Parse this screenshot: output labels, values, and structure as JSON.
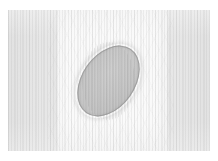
{
  "figure": {
    "kind": "grayscale-field-image",
    "canvas": {
      "width_px": 218,
      "height_px": 161,
      "page_background": "#ffffff"
    },
    "field_region": {
      "left_px": 8,
      "top_px": 10,
      "width_px": 202,
      "height_px": 141,
      "background_color": "#fbfbfb"
    },
    "background_bands": [
      {
        "name": "left-band",
        "left_px": 0,
        "width_px": 49,
        "color": "#e6e6e6",
        "tone": "darker"
      },
      {
        "name": "center-band",
        "left_px": 49,
        "width_px": 110,
        "color": "#fafafa",
        "tone": "lighter"
      },
      {
        "name": "right-band",
        "left_px": 159,
        "width_px": 43,
        "color": "#e6e6e6",
        "tone": "darker"
      }
    ],
    "texture": {
      "name": "vertical-line-striping",
      "orientation": "vertical",
      "fine_period_px": 3,
      "coarse_period_px": 7,
      "stripe_color": "#969696"
    },
    "object": {
      "name": "ellipse",
      "shape": "ellipse",
      "center_x_px": 108,
      "center_y_px": 81,
      "major_axis_px": 78,
      "minor_axis_px": 53,
      "rotation_deg": 35,
      "bounds": {
        "x1_px": 82,
        "y1_px": 42,
        "x2_px": 135,
        "y2_px": 120
      },
      "fill_color": "#c8c8c8",
      "rim_color": "#8c8c8c",
      "highlight_color": "#cfcfcf"
    }
  },
  "chart_data": {
    "type": "heatmap",
    "title": "",
    "xlabel": "",
    "ylabel": "",
    "grid": false,
    "legend": "none",
    "colormap": "grayscale",
    "value_range": [
      0.7,
      1.0
    ],
    "xlim": [
      0,
      202
    ],
    "ylim": [
      0,
      141
    ],
    "tick_labels_x": [],
    "tick_labels_y": [],
    "annotations": [],
    "regions": [
      {
        "name": "left-band",
        "x_range": [
          0,
          49
        ],
        "intensity": 0.9
      },
      {
        "name": "center-band",
        "x_range": [
          49,
          159
        ],
        "intensity": 0.98
      },
      {
        "name": "right-band",
        "x_range": [
          159,
          202
        ],
        "intensity": 0.9
      },
      {
        "name": "ellipse",
        "center": [
          100,
          71
        ],
        "semi_axes": [
          26,
          39
        ],
        "rotation_deg": 35,
        "intensity": 0.78
      }
    ],
    "series": [
      {
        "name": "horizontal-intensity-profile",
        "x": [
          0,
          20,
          40,
          49,
          60,
          80,
          100,
          120,
          140,
          159,
          180,
          202
        ],
        "values": [
          0.9,
          0.9,
          0.91,
          0.94,
          0.98,
          0.86,
          0.78,
          0.85,
          0.98,
          0.94,
          0.9,
          0.9
        ]
      }
    ]
  }
}
